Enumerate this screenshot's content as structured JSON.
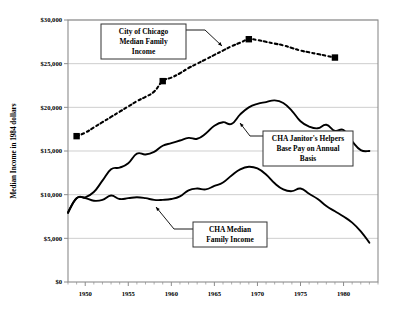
{
  "chart_data": {
    "type": "line",
    "title": "",
    "xlabel": "",
    "ylabel": "Median Income in 1984 dollars",
    "xlim": [
      1948,
      1984
    ],
    "ylim": [
      0,
      30000
    ],
    "grid": true,
    "legend_position": "annotations-inline",
    "y_ticks": [
      0,
      5000,
      10000,
      15000,
      20000,
      25000,
      30000
    ],
    "y_tick_labels": [
      "$0",
      "$5,000",
      "$10,000",
      "$15,000",
      "$20,000",
      "$25,000",
      "$30,000"
    ],
    "x_ticks": [
      1950,
      1955,
      1960,
      1965,
      1970,
      1975,
      1980
    ],
    "x_tick_labels": [
      "1950",
      "1955",
      "1960",
      "1965",
      "1970",
      "1975",
      "1980"
    ],
    "x_minor_tick_step": 1,
    "series": [
      {
        "name": "City of Chicago Median Family Income",
        "style": "dashed",
        "markers": "square",
        "marker_points": [
          {
            "x": 1949,
            "y": 16700
          },
          {
            "x": 1959,
            "y": 23000
          },
          {
            "x": 1969,
            "y": 27800
          },
          {
            "x": 1979,
            "y": 25700
          }
        ],
        "x": [
          1949,
          1950,
          1951,
          1952,
          1953,
          1954,
          1955,
          1956,
          1957,
          1958,
          1959,
          1960,
          1961,
          1962,
          1963,
          1964,
          1965,
          1966,
          1967,
          1968,
          1969,
          1970,
          1971,
          1972,
          1973,
          1974,
          1975,
          1976,
          1977,
          1978,
          1979
        ],
        "values": [
          16700,
          17100,
          17700,
          18300,
          18900,
          19500,
          20100,
          20700,
          21200,
          21800,
          23000,
          23400,
          23900,
          24500,
          25000,
          25500,
          26000,
          26500,
          27000,
          27400,
          27800,
          27700,
          27500,
          27300,
          27100,
          26800,
          26500,
          26300,
          26100,
          25900,
          25700
        ]
      },
      {
        "name": "CHA Janitor's Helpers Base Pay on Annual Basis",
        "style": "solid",
        "markers": "none",
        "x": [
          1948,
          1949,
          1950,
          1951,
          1952,
          1953,
          1954,
          1955,
          1956,
          1957,
          1958,
          1959,
          1960,
          1961,
          1962,
          1963,
          1964,
          1965,
          1966,
          1967,
          1968,
          1969,
          1970,
          1971,
          1972,
          1973,
          1974,
          1975,
          1976,
          1977,
          1978,
          1979,
          1980,
          1981,
          1982,
          1983
        ],
        "values": [
          8000,
          9600,
          9700,
          10300,
          11600,
          12900,
          13100,
          13600,
          14700,
          14600,
          14900,
          15600,
          15900,
          16200,
          16500,
          16400,
          17000,
          17900,
          18300,
          18100,
          19200,
          20000,
          20400,
          20600,
          20800,
          20500,
          19600,
          18400,
          17800,
          17600,
          18000,
          17300,
          17400,
          16100,
          15100,
          15000
        ]
      },
      {
        "name": "CHA Median Family Income",
        "style": "solid",
        "markers": "none",
        "x": [
          1948,
          1949,
          1950,
          1951,
          1952,
          1953,
          1954,
          1955,
          1956,
          1957,
          1958,
          1959,
          1960,
          1961,
          1962,
          1963,
          1964,
          1965,
          1966,
          1967,
          1968,
          1969,
          1970,
          1971,
          1972,
          1973,
          1974,
          1975,
          1976,
          1977,
          1978,
          1979,
          1980,
          1981,
          1982,
          1983
        ],
        "values": [
          7900,
          9600,
          9600,
          9300,
          9400,
          9900,
          9500,
          9600,
          9700,
          9600,
          9400,
          9400,
          9500,
          9800,
          10500,
          10700,
          10600,
          11000,
          11400,
          12200,
          12900,
          13200,
          13000,
          12300,
          11300,
          10600,
          10400,
          10700,
          10100,
          9500,
          8700,
          8100,
          7500,
          6800,
          5800,
          4500
        ]
      }
    ],
    "annotations": [
      {
        "id": "chicago-label",
        "lines": [
          "City of Chicago",
          "Median Family",
          "Income"
        ],
        "box": {
          "x": 101,
          "y": 24,
          "w": 85,
          "h": 35
        },
        "leader": [
          [
            186,
            30
          ],
          [
            205,
            30
          ],
          [
            222,
            46
          ]
        ]
      },
      {
        "id": "janitors-label",
        "lines": [
          "CHA Janitor's Helpers",
          "Base Pay on Annual",
          "Basis"
        ],
        "box": {
          "x": 263,
          "y": 131,
          "w": 90,
          "h": 35
        },
        "leader": [
          [
            263,
            136
          ],
          [
            250,
            136
          ],
          [
            240,
            123
          ]
        ]
      },
      {
        "id": "cha-median-label",
        "lines": [
          "CHA Median",
          "Family Income"
        ],
        "box": {
          "x": 193,
          "y": 222,
          "w": 74,
          "h": 25
        },
        "leader": [
          [
            193,
            229
          ],
          [
            174,
            229
          ],
          [
            156,
            207
          ]
        ]
      }
    ]
  },
  "plot": {
    "left": 68,
    "right": 378,
    "top": 20,
    "bottom": 282
  }
}
